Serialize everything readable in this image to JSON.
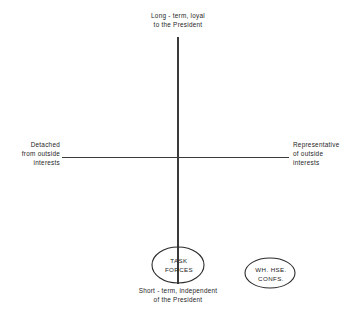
{
  "diagram": {
    "background_color": "#ffffff",
    "line_color": "#3a3a3a",
    "text_color": "#262626",
    "axes": {
      "vertical": {
        "top_label": "Long - term, loyal\nto the President",
        "bottom_label": "Short - term, independent\nof the President",
        "x": 178,
        "y_top": 37,
        "y_bottom": 284
      },
      "horizontal": {
        "left_label": "Detached\nfrom outside\ninterests",
        "right_label": "Representative\nof outside\ninterests",
        "y": 157,
        "x_left": 62,
        "x_right": 289
      }
    },
    "nodes": [
      {
        "id": "task-forces",
        "label": "TASK\nFORCES",
        "shape": "ellipse",
        "cx": 178,
        "cy": 265,
        "rx": 26,
        "ry": 18
      },
      {
        "id": "wh-hse-confs",
        "label": "WH. HSE.\nCONFS.",
        "shape": "ellipse",
        "cx": 270,
        "cy": 273,
        "rx": 25,
        "ry": 15
      }
    ]
  }
}
